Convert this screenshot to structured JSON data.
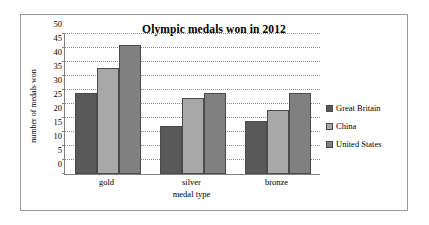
{
  "chart_data": {
    "type": "bar",
    "title": "Olympic medals won in 2012",
    "xlabel": "medal type",
    "ylabel": "number of medals won",
    "categories": [
      "gold",
      "silver",
      "bronze"
    ],
    "series": [
      {
        "name": "Great Britain",
        "values": [
          29,
          17,
          19
        ],
        "color": "#595959"
      },
      {
        "name": "China",
        "values": [
          38,
          27,
          23
        ],
        "color": "#a8a8a8"
      },
      {
        "name": "United States",
        "values": [
          46,
          29,
          29
        ],
        "color": "#808080"
      }
    ],
    "ylim": [
      0,
      50
    ],
    "ytick_step": 5,
    "yticks": [
      0,
      5,
      10,
      15,
      20,
      25,
      30,
      35,
      40,
      45,
      50
    ],
    "grid": true,
    "grid_axis": "y",
    "legend_position": "right",
    "bar_border_color": "#4a4a4a",
    "gridline_color": "#8d8d8d",
    "axis_color": "#808080",
    "frame_border_color": "#9a9a9a",
    "background_color": "#ffffff",
    "text_color": "#000000"
  }
}
